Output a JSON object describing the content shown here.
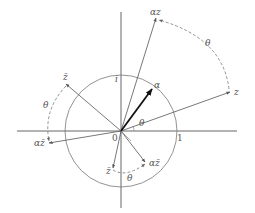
{
  "diagram": {
    "type": "complex-plane rotation diagram",
    "origin_label": "0",
    "unit_label": "1",
    "imag_unit_label": "i",
    "alpha_label": "α",
    "z_label": "z",
    "alpha_z_label": "αz",
    "zbar_label": "z̄",
    "alpha_zbar_label": "αz̄",
    "neg_zbar_label": "z̄",
    "alpha_zbar_rotated_label": "αz̄",
    "theta_label": "θ",
    "colors": {
      "axis": "#555555",
      "circle": "#777777",
      "vector": "#555555",
      "alpha_vector": "#111111",
      "arc": "#888888"
    }
  }
}
